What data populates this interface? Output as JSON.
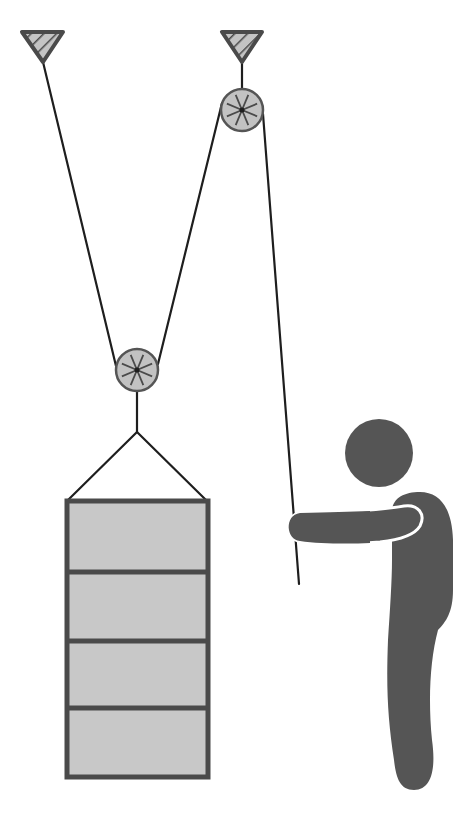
{
  "diagram": {
    "colors": {
      "background": "#ffffff",
      "rope": "#1e1e1e",
      "anchor_fill": "#c4c4c4",
      "anchor_stroke": "#4a4a4a",
      "pulley_fill": "#c2c2c2",
      "pulley_stroke": "#555555",
      "spoke": "#4a4a4a",
      "box_fill": "#c8c8c8",
      "box_stroke": "#4a4a4a",
      "person": "#555555"
    },
    "anchors": [
      {
        "id": "left-anchor",
        "points": [
          [
            22,
            32
          ],
          [
            63,
            32
          ],
          [
            43,
            62
          ]
        ]
      },
      {
        "id": "right-anchor",
        "points": [
          [
            222,
            32
          ],
          [
            262,
            32
          ],
          [
            242,
            62
          ]
        ]
      }
    ],
    "pulleys": [
      {
        "id": "fixed-pulley",
        "cx": 242,
        "cy": 110,
        "r": 21
      },
      {
        "id": "movable-pulley",
        "cx": 137,
        "cy": 370,
        "r": 21
      }
    ],
    "ropes": [
      {
        "id": "rope-left-anchor-to-movable",
        "x1": 43,
        "y1": 62,
        "x2": 116,
        "y2": 366
      },
      {
        "id": "rope-movable-to-fixed",
        "x1": 158,
        "y1": 364,
        "x2": 222,
        "y2": 103
      },
      {
        "id": "rope-fixed-anchor-to-pulley",
        "x1": 242,
        "y1": 62,
        "x2": 242,
        "y2": 110
      },
      {
        "id": "rope-pull-end",
        "x1": 263,
        "y1": 114,
        "x2": 299,
        "y2": 584
      },
      {
        "id": "hanger-stem",
        "x1": 137,
        "y1": 370,
        "x2": 137,
        "y2": 432
      },
      {
        "id": "sling-left",
        "x1": 137,
        "y1": 432,
        "x2": 67,
        "y2": 501
      },
      {
        "id": "sling-right",
        "x1": 137,
        "y1": 432,
        "x2": 207,
        "y2": 501
      }
    ],
    "load": {
      "x": 67,
      "y": 501,
      "width": 141,
      "height": 276,
      "sections": 4,
      "dividers_y": [
        572,
        641,
        708
      ]
    },
    "person": {
      "head": {
        "cx": 379,
        "cy": 453,
        "r": 34
      }
    }
  }
}
